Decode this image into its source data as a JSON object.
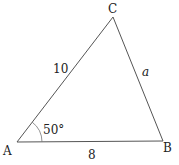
{
  "diagram": {
    "type": "triangle",
    "vertices": [
      {
        "label": "A",
        "x": 17,
        "y": 142,
        "lx": 3,
        "ly": 155
      },
      {
        "label": "B",
        "x": 163,
        "y": 141,
        "lx": 163,
        "ly": 152
      },
      {
        "label": "C",
        "x": 113,
        "y": 17,
        "lx": 108,
        "ly": 13
      }
    ],
    "sides": [
      {
        "name": "AC",
        "label": "10",
        "x": 53,
        "y": 73,
        "italic": false
      },
      {
        "name": "BC",
        "label": "a",
        "x": 142,
        "y": 76,
        "italic": true
      },
      {
        "name": "AB",
        "label": "8",
        "x": 88,
        "y": 159,
        "italic": false
      }
    ],
    "angle": {
      "vertex": "A",
      "label": "50°",
      "x": 43,
      "y": 134
    },
    "stroke_color": "#555555",
    "text_color": "#222222"
  }
}
